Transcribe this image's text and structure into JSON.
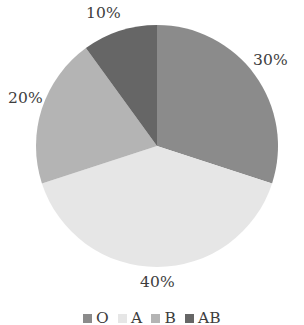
{
  "chart_data": {
    "type": "pie",
    "title": "",
    "xlabel": "",
    "ylabel": "",
    "categories": [
      "O",
      "A",
      "B",
      "AB"
    ],
    "values": [
      30,
      40,
      20,
      10
    ],
    "value_unit": "%",
    "data_labels": [
      "30%",
      "40%",
      "20%",
      "10%"
    ],
    "colors": [
      "#8b8b8b",
      "#e6e6e6",
      "#b4b4b4",
      "#666666"
    ],
    "start_angle_deg": 0,
    "direction": "clockwise",
    "grid": false,
    "legend": {
      "position": "bottom",
      "entries": [
        {
          "label": "O",
          "color": "#8b8b8b"
        },
        {
          "label": "A",
          "color": "#e6e6e6"
        },
        {
          "label": "B",
          "color": "#b4b4b4"
        },
        {
          "label": "AB",
          "color": "#666666"
        }
      ]
    },
    "slices": [
      {
        "name": "O",
        "value": 30,
        "label": "30%",
        "color": "#8b8b8b"
      },
      {
        "name": "A",
        "value": 40,
        "label": "40%",
        "color": "#e6e6e6"
      },
      {
        "name": "B",
        "value": 20,
        "label": "20%",
        "color": "#b4b4b4"
      },
      {
        "name": "AB",
        "value": 10,
        "label": "10%",
        "color": "#666666"
      }
    ]
  },
  "labels": {
    "o": "30%",
    "a": "40%",
    "b": "20%",
    "ab": "10%"
  },
  "legend": {
    "o": "O",
    "a": "A",
    "b": "B",
    "ab": "AB"
  },
  "geometry": {
    "center_x": 157,
    "center_y": 146,
    "radius": 121
  }
}
